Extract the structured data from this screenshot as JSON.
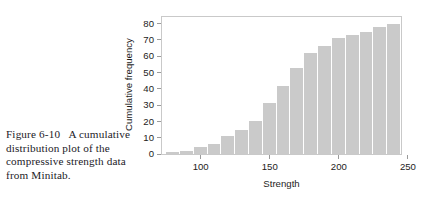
{
  "caption": {
    "figure_label": "Figure 6-10",
    "gap": "   ",
    "text": "A cumulative distribution plot of the compressive strength data from Minitab."
  },
  "colors": {
    "bar_fill": "#cacaca",
    "frame": "#c9c9c9",
    "text": "#1d1c1b",
    "background": "#ffffff"
  },
  "chart_data": {
    "type": "bar",
    "title": "",
    "subtitle": "",
    "xlabel": "Strength",
    "ylabel": "Cumulative frequency",
    "xlim": [
      72,
      245
    ],
    "ylim": [
      0,
      84
    ],
    "grid": false,
    "legend": null,
    "xticks": [
      100,
      150,
      200,
      250
    ],
    "xtick_labels": [
      "100",
      "150",
      "200",
      "250"
    ],
    "yticks": [
      0,
      10,
      20,
      30,
      40,
      50,
      60,
      70,
      80
    ],
    "ytick_labels": [
      "0",
      "10",
      "20",
      "30",
      "40",
      "50",
      "60",
      "70",
      "80"
    ],
    "bin_width": 10,
    "x": [
      80,
      90,
      100,
      110,
      120,
      130,
      140,
      150,
      160,
      170,
      180,
      190,
      200,
      210,
      220,
      230,
      240
    ],
    "categories": [
      "75-85",
      "85-95",
      "95-105",
      "105-115",
      "115-125",
      "125-135",
      "135-145",
      "145-155",
      "155-165",
      "165-175",
      "175-185",
      "185-195",
      "195-205",
      "205-215",
      "215-225",
      "225-235",
      "235-245"
    ],
    "values": [
      1,
      2,
      4,
      6,
      11,
      15,
      20,
      31,
      42,
      53,
      62,
      66,
      71,
      73,
      75,
      78,
      80
    ]
  }
}
